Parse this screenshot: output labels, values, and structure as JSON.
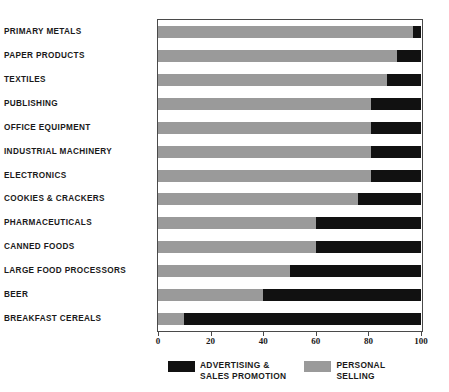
{
  "chart_data": {
    "type": "bar",
    "orientation": "horizontal",
    "stacked": true,
    "title": "",
    "subtitle": "",
    "xlabel": "",
    "ylabel": "",
    "xlim": [
      0,
      100
    ],
    "xticks": [
      0,
      20,
      40,
      60,
      80,
      100
    ],
    "xtick_labels": [
      "0",
      "20",
      "40",
      "60",
      "80",
      "100"
    ],
    "grid": false,
    "legend_position": "bottom",
    "categories": [
      "PRIMARY METALS",
      "PAPER PRODUCTS",
      "TEXTILES",
      "PUBLISHING",
      "OFFICE EQUIPMENT",
      "INDUSTRIAL MACHINERY",
      "ELECTRONICS",
      "COOKIES & CRACKERS",
      "PHARMACEUTICALS",
      "CANNED FOODS",
      "LARGE FOOD PROCESSORS",
      "BEER",
      "BREAKFAST CEREALS"
    ],
    "series": [
      {
        "name": "PERSONAL SELLING",
        "color": "#9a9a9a",
        "values": [
          97,
          91,
          87,
          81,
          81,
          81,
          81,
          76,
          60,
          60,
          50,
          40,
          10
        ]
      },
      {
        "name": "ADVERTISING & SALES PROMOTION",
        "color": "#111111",
        "values": [
          3,
          9,
          13,
          19,
          19,
          19,
          19,
          24,
          40,
          40,
          50,
          60,
          90
        ]
      }
    ]
  },
  "legend": {
    "entries": [
      {
        "label_line1": "ADVERTISING &",
        "label_line2": "SALES PROMOTION",
        "swatch_color": "#111111"
      },
      {
        "label_line1": "PERSONAL",
        "label_line2": "SELLING",
        "swatch_color": "#9a9a9a"
      }
    ]
  }
}
